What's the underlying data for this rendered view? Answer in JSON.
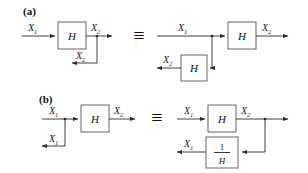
{
  "figure": {
    "background_color": "#ffffff",
    "line_color": "#2a2a2a",
    "box_stroke_color": "#555555",
    "text_color": "#111111",
    "width": 308,
    "height": 173
  },
  "panels": [
    {
      "id": "a",
      "label": "(a)",
      "equivalence_symbol": "≡",
      "left_diagram": {
        "name": "single-block-with-output-tap",
        "blocks": [
          {
            "name": "block-H",
            "label": "H"
          }
        ],
        "signals": [
          {
            "name": "input-label",
            "base": "X",
            "sub": "1"
          },
          {
            "name": "output-label",
            "base": "X",
            "sub": "2"
          },
          {
            "name": "feedback-tap-label",
            "base": "X",
            "sub": "2"
          }
        ]
      },
      "right_diagram": {
        "name": "forward-block-with-parallel-feedback-block",
        "blocks": [
          {
            "name": "block-H-forward",
            "label": "H"
          },
          {
            "name": "block-H-feedback",
            "label": "H"
          }
        ],
        "signals": [
          {
            "name": "input-label",
            "base": "X",
            "sub": "1"
          },
          {
            "name": "output-label",
            "base": "X",
            "sub": "2"
          },
          {
            "name": "feedback-output-label",
            "base": "X",
            "sub": "2"
          }
        ]
      }
    },
    {
      "id": "b",
      "label": "(b)",
      "equivalence_symbol": "≡",
      "left_diagram": {
        "name": "input-tap-with-block",
        "blocks": [
          {
            "name": "block-H",
            "label": "H"
          }
        ],
        "signals": [
          {
            "name": "input-label",
            "base": "X",
            "sub": "1"
          },
          {
            "name": "output-label",
            "base": "X",
            "sub": "2"
          },
          {
            "name": "input-tap-label",
            "base": "X",
            "sub": "1"
          }
        ]
      },
      "right_diagram": {
        "name": "forward-block-with-inverse-feedback-block",
        "blocks": [
          {
            "name": "block-H-forward",
            "label": "H"
          },
          {
            "name": "block-inverse-H",
            "numerator": "1",
            "denominator": "H"
          }
        ],
        "signals": [
          {
            "name": "input-label",
            "base": "X",
            "sub": "1"
          },
          {
            "name": "output-label",
            "base": "X",
            "sub": "2"
          },
          {
            "name": "feedback-output-label",
            "base": "X",
            "sub": "1"
          }
        ]
      }
    }
  ]
}
